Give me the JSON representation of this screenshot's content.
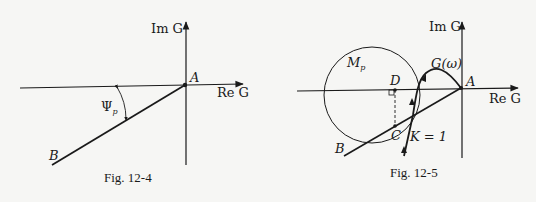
{
  "figures": [
    {
      "caption": "Fig. 12-4",
      "axis_labels": {
        "imag": "Im G",
        "real": "Re G"
      },
      "points": {
        "A": "A",
        "B": "B"
      },
      "angle_label": "Ψ",
      "angle_subscript": "p"
    },
    {
      "caption": "Fig. 12-5",
      "axis_labels": {
        "imag": "Im G",
        "real": "Re G"
      },
      "points": {
        "A": "A",
        "B": "B",
        "C": "C",
        "D": "D"
      },
      "circle_label": "M",
      "circle_subscript": "p",
      "curve_label": "G(ω)",
      "gain_label": "K = 1"
    }
  ],
  "colors": {
    "ink": "#1a1a1a",
    "paper": "#f6f6f4"
  }
}
